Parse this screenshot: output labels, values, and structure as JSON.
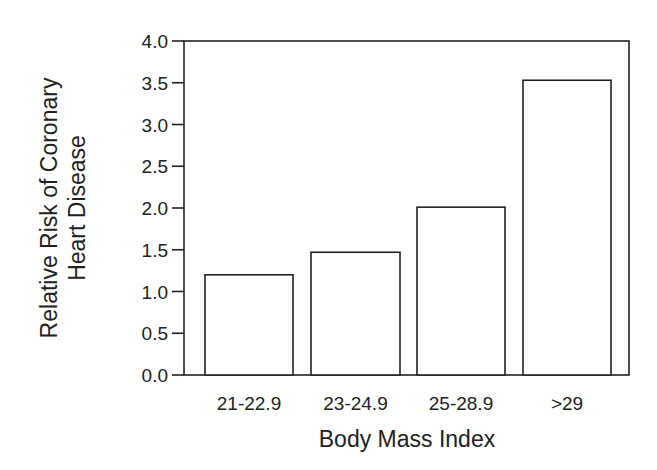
{
  "chart_data": {
    "type": "bar",
    "title": "",
    "categories": [
      "21-22.9",
      "23-24.9",
      "25-28.9",
      ">29"
    ],
    "values": [
      1.2,
      1.47,
      2.01,
      3.53
    ],
    "xlabel": "Body Mass Index",
    "ylabel": [
      "Relative Risk of Coronary",
      "Heart Disease"
    ],
    "ylim": [
      0.0,
      4.0
    ],
    "yticks": [
      "0.0",
      "0.5",
      "1.0",
      "1.5",
      "2.0",
      "2.5",
      "3.0",
      "3.5",
      "4.0"
    ],
    "grid": false,
    "legend": null,
    "bar_fill": "#ffffff",
    "bar_stroke": "#222222"
  }
}
